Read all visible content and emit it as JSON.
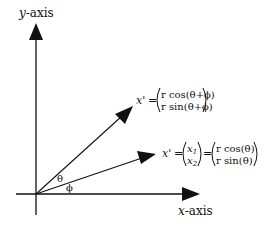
{
  "diagram": {
    "axes": {
      "y_label_var": "y",
      "y_label_suffix": "-axis",
      "x_label_var": "x",
      "x_label_suffix": "-axis"
    },
    "angles": {
      "theta": "θ",
      "phi": "ϕ"
    },
    "vectors": [
      {
        "name": "rotated",
        "lhs": "x'",
        "eq": "=",
        "rows": [
          "r cos(θ+ϕ)",
          "r sin(θ+ϕ)"
        ]
      },
      {
        "name": "original",
        "lhs": "x'",
        "eq": "=",
        "middle_rows": [
          "x1",
          "x2"
        ],
        "middle_sub": [
          "1",
          "2"
        ],
        "rows": [
          "r cos(θ)",
          "r sin(θ)"
        ]
      }
    ],
    "colors": {
      "stroke": "#111111",
      "background": "#ffffff"
    }
  }
}
